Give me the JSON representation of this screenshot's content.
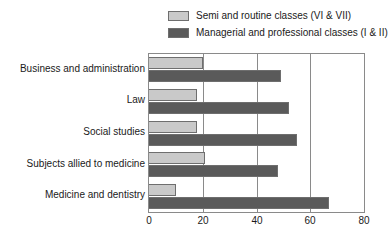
{
  "chart_data": {
    "type": "bar",
    "orientation": "horizontal",
    "title": "",
    "subtitle": "",
    "xlabel": "",
    "ylabel": "",
    "xlim": [
      0,
      80
    ],
    "xticks": [
      0,
      20,
      40,
      60,
      80
    ],
    "grid": true,
    "grid_axis": "x",
    "legend_position": "top",
    "categories": [
      "Business and administration",
      "Law",
      "Social studies",
      "Subjects allied to medicine",
      "Medicine and dentistry"
    ],
    "series": [
      {
        "name": "Semi and routine classes (VI & VII)",
        "color": "#c9c9c9",
        "values": [
          20,
          18,
          18,
          21,
          10
        ]
      },
      {
        "name": "Managerial and professional classes (I & II)",
        "color": "#5a5a5a",
        "values": [
          49,
          52,
          55,
          48,
          67
        ]
      }
    ]
  },
  "legend": {
    "items": [
      {
        "label": "Semi and routine classes (VI & VII)",
        "swatch": "#c9c9c9"
      },
      {
        "label": "Managerial and professional classes (I & II)",
        "swatch": "#5a5a5a"
      }
    ]
  },
  "axis": {
    "x_tick_labels": [
      "0",
      "20",
      "40",
      "60",
      "80"
    ]
  }
}
